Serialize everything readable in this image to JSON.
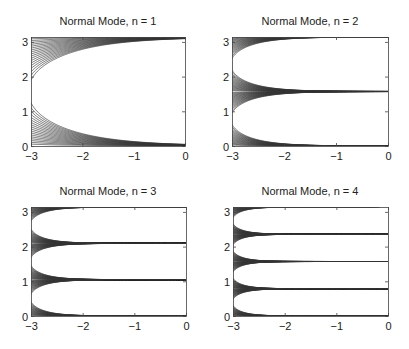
{
  "figure": {
    "width": 409,
    "height": 349,
    "line_color": "#333333",
    "axis_color": "#444444"
  },
  "chart_data": [
    {
      "type": "contour",
      "title": "Normal Mode, n = 1",
      "n": 1,
      "function": "exp(n*x) * sin(n*y)",
      "xlim": [
        -3,
        0
      ],
      "ylim": [
        0,
        3.14159
      ],
      "xticks": [
        "-3",
        "-2",
        "-1",
        "0"
      ],
      "yticks": [
        "0",
        "1",
        "2",
        "3"
      ],
      "levels_count": 18,
      "box": {
        "left": 31,
        "top": 37,
        "right": 185,
        "bottom": 146
      }
    },
    {
      "type": "contour",
      "title": "Normal Mode, n = 2",
      "n": 2,
      "function": "exp(n*x) * sin(n*y)",
      "xlim": [
        -3,
        0
      ],
      "ylim": [
        0,
        3.14159
      ],
      "xticks": [
        "-3",
        "-2",
        "-1",
        "0"
      ],
      "yticks": [
        "0",
        "1",
        "2",
        "3"
      ],
      "levels_count": 18,
      "box": {
        "left": 232,
        "top": 37,
        "right": 388,
        "bottom": 146
      }
    },
    {
      "type": "contour",
      "title": "Normal Mode, n = 3",
      "n": 3,
      "function": "exp(n*x) * sin(n*y)",
      "xlim": [
        -3,
        0
      ],
      "ylim": [
        0,
        3.14159
      ],
      "xticks": [
        "-3",
        "-2",
        "-1",
        "0"
      ],
      "yticks": [
        "0",
        "1",
        "2",
        "3"
      ],
      "levels_count": 18,
      "box": {
        "left": 31,
        "top": 207,
        "right": 186,
        "bottom": 316
      }
    },
    {
      "type": "contour",
      "title": "Normal Mode, n = 4",
      "n": 4,
      "function": "exp(n*x) * sin(n*y)",
      "xlim": [
        -3,
        0
      ],
      "ylim": [
        0,
        3.14159
      ],
      "xticks": [
        "-3",
        "-2",
        "-1",
        "0"
      ],
      "yticks": [
        "0",
        "1",
        "2",
        "3"
      ],
      "levels_count": 18,
      "box": {
        "left": 233,
        "top": 207,
        "right": 388,
        "bottom": 316
      }
    }
  ]
}
